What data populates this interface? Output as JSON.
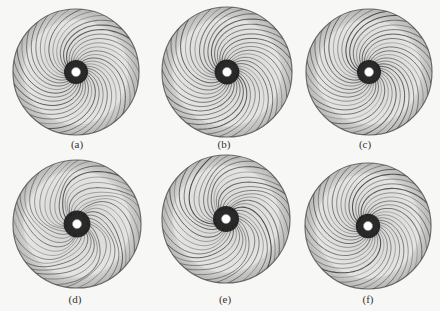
{
  "figure": {
    "colors": {
      "background": "#f7f7f5",
      "disc_fill": "#e4e4e2",
      "streamline": "#3a3a3a",
      "edge": "#6a6a6a",
      "hub_dark": "#111111",
      "hub_core": "#ffffff"
    },
    "panels": [
      {
        "id": "a",
        "label": "(a)",
        "cx": 76,
        "cy": 72,
        "r": 63,
        "label_x": 77,
        "label_y": 138,
        "turbulence": 0.0
      },
      {
        "id": "b",
        "label": "(b)",
        "cx": 227,
        "cy": 72,
        "r": 65,
        "label_x": 224,
        "label_y": 138,
        "turbulence": 0.1
      },
      {
        "id": "c",
        "label": "(c)",
        "cx": 369,
        "cy": 72,
        "r": 63,
        "label_x": 365,
        "label_y": 138,
        "turbulence": 0.0
      },
      {
        "id": "d",
        "label": "(d)",
        "cx": 77,
        "cy": 224,
        "r": 64,
        "label_x": 75,
        "label_y": 293,
        "turbulence": 0.35
      },
      {
        "id": "e",
        "label": "(e)",
        "cx": 226,
        "cy": 219,
        "r": 64,
        "label_x": 225,
        "label_y": 293,
        "turbulence": 0.25
      },
      {
        "id": "f",
        "label": "(f)",
        "cx": 368,
        "cy": 226,
        "r": 63,
        "label_x": 368,
        "label_y": 293,
        "turbulence": 0.05
      }
    ]
  }
}
